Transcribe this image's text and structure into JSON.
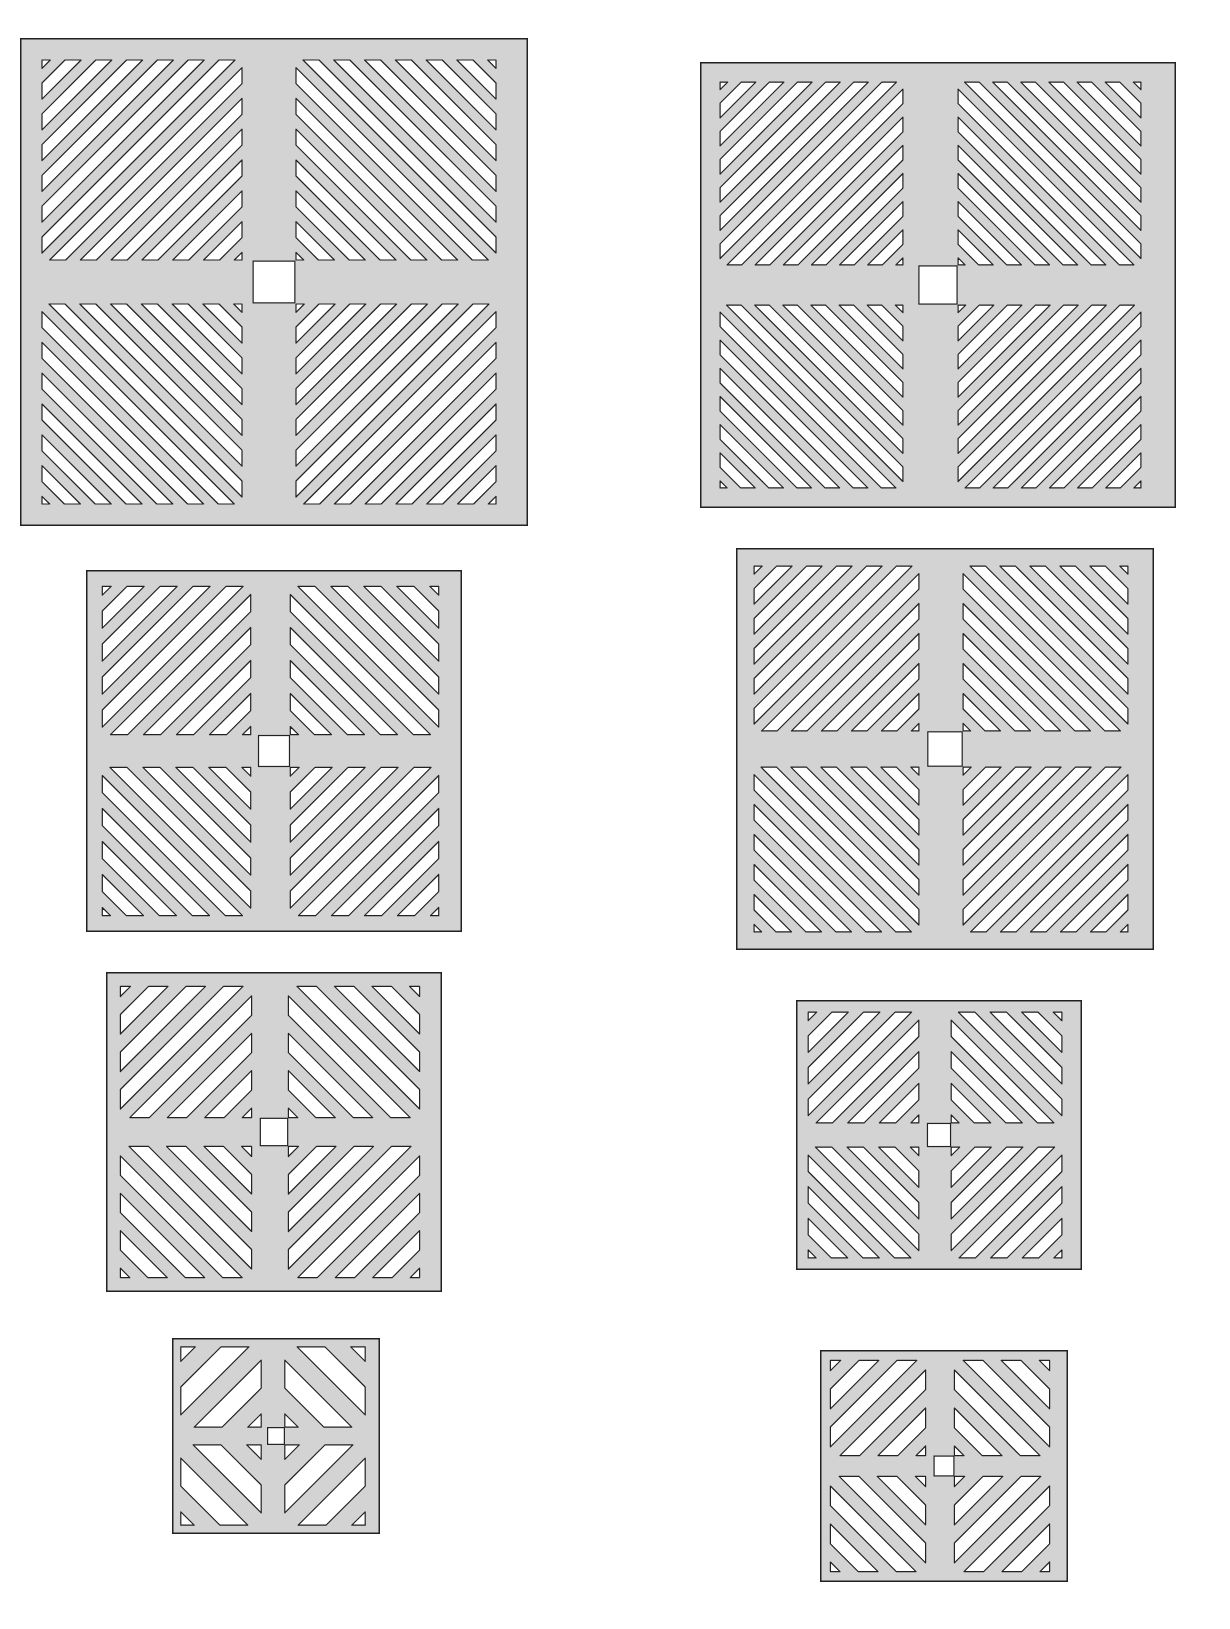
{
  "figure": {
    "colors": {
      "panel_fill": "#d3d3d3",
      "slot_fill": "#ffffff",
      "stroke": "#222222",
      "background": "#ffffff"
    },
    "panels": [
      {
        "id": "left-1",
        "x": 20,
        "y": 38,
        "w": 508,
        "h": 488,
        "slots": 7
      },
      {
        "id": "right-1",
        "x": 700,
        "y": 62,
        "w": 476,
        "h": 446,
        "slots": 7
      },
      {
        "id": "left-2",
        "x": 86,
        "y": 570,
        "w": 376,
        "h": 362,
        "slots": 5
      },
      {
        "id": "right-2",
        "x": 736,
        "y": 548,
        "w": 418,
        "h": 402,
        "slots": 6
      },
      {
        "id": "left-3",
        "x": 106,
        "y": 972,
        "w": 336,
        "h": 320,
        "slots": 4
      },
      {
        "id": "right-3",
        "x": 796,
        "y": 1000,
        "w": 286,
        "h": 270,
        "slots": 4
      },
      {
        "id": "left-4",
        "x": 172,
        "y": 1338,
        "w": 208,
        "h": 196,
        "slots": 2
      },
      {
        "id": "right-4",
        "x": 820,
        "y": 1350,
        "w": 248,
        "h": 232,
        "slots": 3
      }
    ]
  }
}
